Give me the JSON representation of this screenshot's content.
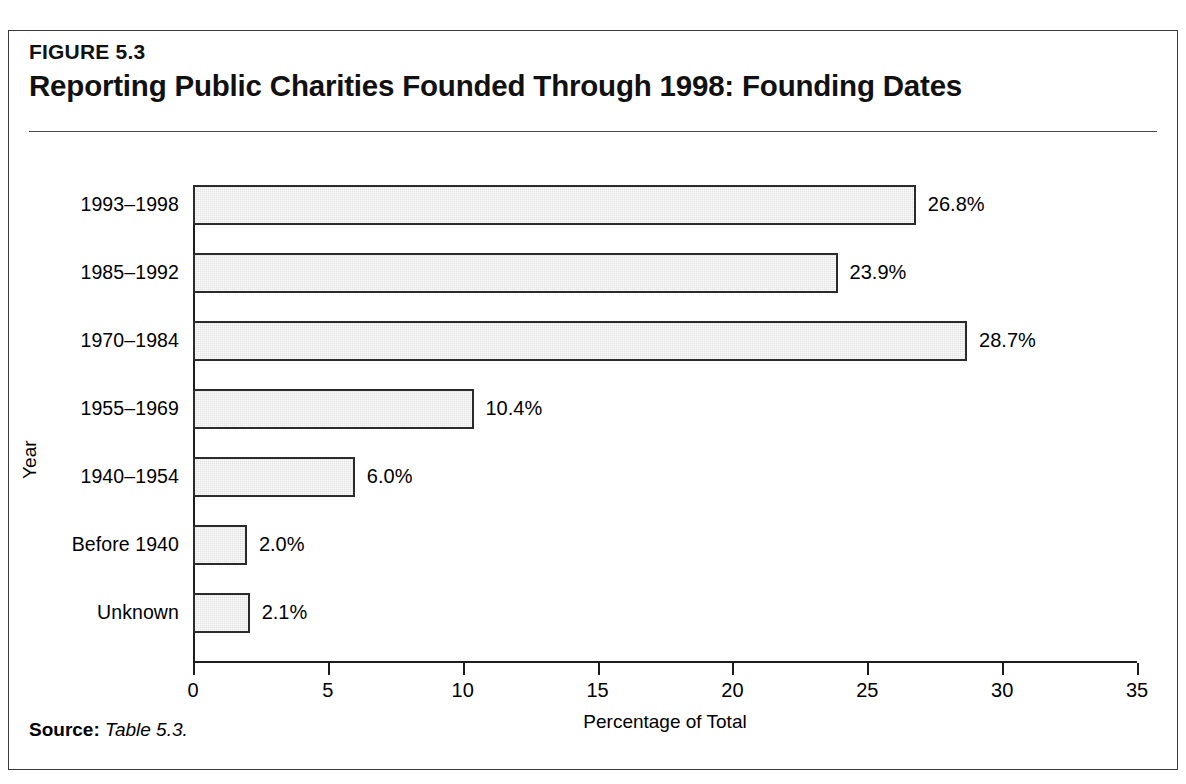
{
  "figure": {
    "number": "FIGURE 5.3",
    "title": "Reporting Public Charities Founded Through 1998: Founding Dates",
    "source_label": "Source:",
    "source_text": "Table 5.3."
  },
  "chart_data": {
    "type": "bar",
    "orientation": "horizontal",
    "title": "Reporting Public Charities Founded Through 1998: Founding Dates",
    "xlabel": "Percentage of Total",
    "ylabel": "Year",
    "xlim": [
      0,
      35
    ],
    "xticks": [
      "0",
      "5",
      "10",
      "15",
      "20",
      "25",
      "30",
      "35"
    ],
    "grid": false,
    "legend": "none",
    "categories": [
      "1993–1998",
      "1985–1992",
      "1970–1984",
      "1955–1969",
      "1940–1954",
      "Before 1940",
      "Unknown"
    ],
    "values": [
      26.8,
      23.9,
      28.7,
      10.4,
      6.0,
      2.0,
      2.1
    ],
    "data_labels": [
      "26.8%",
      "23.9%",
      "28.7%",
      "10.4%",
      "6.0%",
      "2.0%",
      "2.1%"
    ],
    "bar_fill_color": "#e4e4e4",
    "bar_border_color": "#2b2b2b",
    "axis_color": "#1c1c1c"
  }
}
